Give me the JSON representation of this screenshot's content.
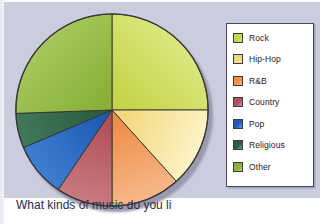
{
  "figure": {
    "caption": "What kinds of music do you li",
    "background_color": "#ccccdf",
    "panel_color": "#ffffff"
  },
  "legend": {
    "name": "chart-legend",
    "border_color": "#4a4a66",
    "entries": [
      {
        "label": "Rock",
        "color": "#c5d54a"
      },
      {
        "label": "Hip-Hop",
        "color": "#f3d87e"
      },
      {
        "label": "R&B",
        "color": "#ef8f4a"
      },
      {
        "label": "Country",
        "color": "#b1505a"
      },
      {
        "label": "Pop",
        "color": "#1f5cb4"
      },
      {
        "label": "Religious",
        "color": "#2d5c42"
      },
      {
        "label": "Other",
        "color": "#8ab03a"
      }
    ]
  },
  "chart_data": {
    "type": "pie",
    "title": "",
    "xlabel": "",
    "ylabel": "",
    "legend_position": "right",
    "grid": false,
    "start_angle_deg": 90,
    "direction": "clockwise",
    "stroke_color": "#333333",
    "categories": [
      "Rock",
      "Hip-Hop",
      "R&B",
      "Country",
      "Pop",
      "Religious",
      "Other"
    ],
    "values": [
      25,
      13,
      12,
      9,
      9,
      6,
      26
    ],
    "angles_deg": [
      90,
      48,
      42,
      34,
      33,
      21,
      92
    ],
    "colors": [
      "#c5d54a",
      "#f3d87e",
      "#ef8f4a",
      "#b1505a",
      "#1f5cb4",
      "#2d5c42",
      "#8ab03a"
    ],
    "highlight_colors": [
      "#dbe77e",
      "#fdf3c8",
      "#f7b88a",
      "#c87b80",
      "#3e7ed0",
      "#3f7a58",
      "#a6c85c"
    ],
    "slices": [
      {
        "label": "Rock",
        "value": 25,
        "angle_deg": 90,
        "color": "#c5d54a"
      },
      {
        "label": "Hip-Hop",
        "value": 13,
        "angle_deg": 48,
        "color": "#f3d87e"
      },
      {
        "label": "R&B",
        "value": 12,
        "angle_deg": 42,
        "color": "#ef8f4a"
      },
      {
        "label": "Country",
        "value": 9,
        "angle_deg": 34,
        "color": "#b1505a"
      },
      {
        "label": "Pop",
        "value": 9,
        "angle_deg": 33,
        "color": "#1f5cb4"
      },
      {
        "label": "Religious",
        "value": 6,
        "angle_deg": 21,
        "color": "#2d5c42"
      },
      {
        "label": "Other",
        "value": 26,
        "angle_deg": 92,
        "color": "#8ab03a"
      }
    ]
  }
}
